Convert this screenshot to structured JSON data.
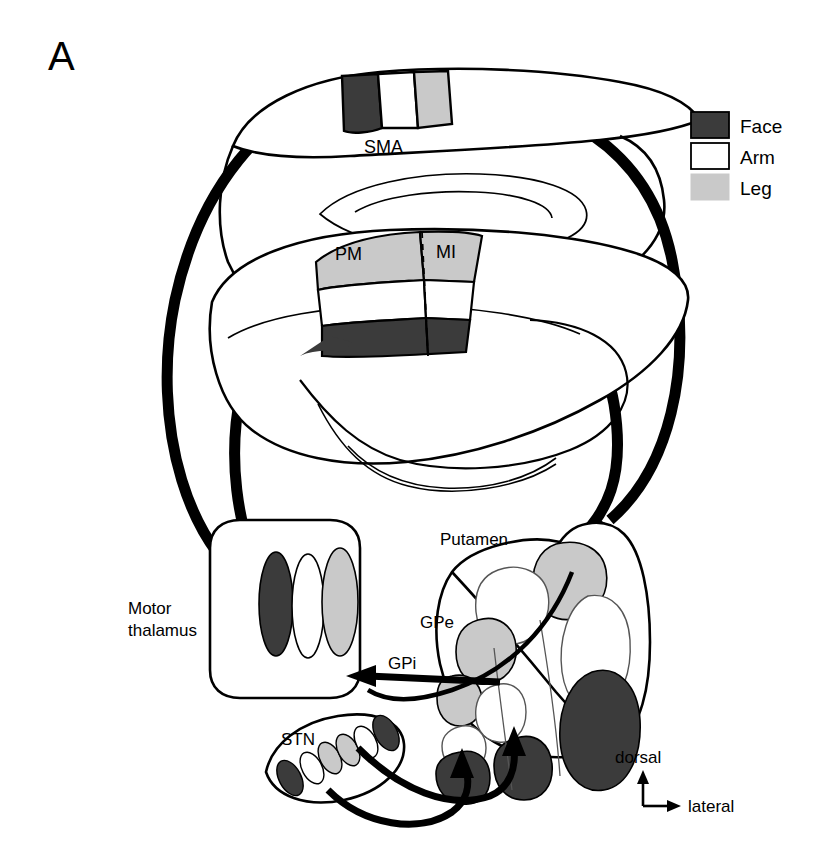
{
  "figure": {
    "panel_label": "A",
    "type": "neuroanatomical-circuit-diagram"
  },
  "legend": {
    "items": [
      {
        "label": "Face",
        "color": "#3b3b3b",
        "swatch": "filled-dark"
      },
      {
        "label": "Arm",
        "color": "#ffffff",
        "swatch": "outline-white"
      },
      {
        "label": "Leg",
        "color": "#c9c9c9",
        "swatch": "filled-gray"
      }
    ]
  },
  "cortex": {
    "medial_view": {
      "region_label": "SMA",
      "bands": [
        {
          "part": "Face",
          "color": "#3b3b3b"
        },
        {
          "part": "Arm",
          "color": "#ffffff"
        },
        {
          "part": "Leg",
          "color": "#c9c9c9"
        }
      ]
    },
    "lateral_view": {
      "region_labels": [
        "PM",
        "MI"
      ],
      "bands": [
        {
          "part": "Leg",
          "color": "#c9c9c9"
        },
        {
          "part": "Arm",
          "color": "#ffffff"
        },
        {
          "part": "Face",
          "color": "#3b3b3b"
        }
      ]
    }
  },
  "nuclei": {
    "thalamus": {
      "label_line1": "Motor",
      "label_line2": "thalamus",
      "bands": [
        {
          "part": "Face",
          "color": "#3b3b3b"
        },
        {
          "part": "Arm",
          "color": "#ffffff"
        },
        {
          "part": "Leg",
          "color": "#c9c9c9"
        }
      ]
    },
    "putamen": {
      "label": "Putamen"
    },
    "gpe": {
      "label": "GPe"
    },
    "gpi": {
      "label": "GPi"
    },
    "stn": {
      "label": "STN"
    }
  },
  "orientation": {
    "vertical_label": "dorsal",
    "horizontal_label": "lateral"
  },
  "colors": {
    "face": "#3b3b3b",
    "arm": "#ffffff",
    "leg": "#c9c9c9",
    "outline": "#000000",
    "thin_outline": "#1a1a1a",
    "background": "#ffffff"
  }
}
